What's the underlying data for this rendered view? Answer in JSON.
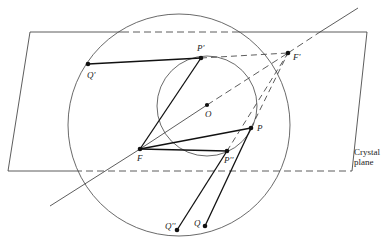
{
  "figure": {
    "caption_label": [
      "Crystal",
      "plane"
    ],
    "points": {
      "Q_prime": {
        "label": "Q'",
        "x": 88,
        "y": 64
      },
      "P_prime": {
        "label": "P'",
        "x": 201,
        "y": 58
      },
      "F_prime": {
        "label": "F'",
        "x": 288,
        "y": 53
      },
      "O": {
        "label": "O",
        "x": 207,
        "y": 105
      },
      "P": {
        "label": "P",
        "x": 251,
        "y": 128
      },
      "F": {
        "label": "F",
        "x": 140,
        "y": 149
      },
      "P_dprime": {
        "label": "P''",
        "x": 227,
        "y": 151
      },
      "Q_dprime": {
        "label": "Q''",
        "x": 177,
        "y": 230
      },
      "Q": {
        "label": "Q",
        "x": 205,
        "y": 226
      }
    },
    "colors": {
      "ink": "#222222",
      "background": "#ffffff"
    }
  }
}
